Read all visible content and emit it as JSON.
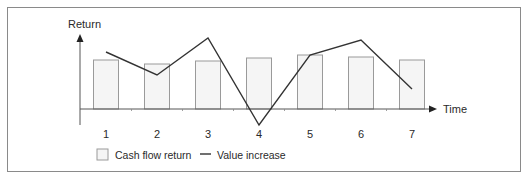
{
  "chart_data": {
    "type": "bar+line",
    "title": "",
    "xlabel": "Time",
    "ylabel": "Return",
    "categories": [
      "1",
      "2",
      "3",
      "4",
      "5",
      "6",
      "7"
    ],
    "series": [
      {
        "name": "Cash flow return",
        "kind": "bar",
        "values": [
          49,
          45,
          48,
          51,
          54,
          52,
          49
        ]
      },
      {
        "name": "Value increase",
        "kind": "line",
        "values": [
          57,
          34,
          71,
          -16,
          54,
          69,
          20
        ]
      }
    ],
    "axis_ranges": {
      "y": [
        -20,
        75
      ]
    },
    "grid": false,
    "legend_position": "bottom"
  },
  "axes": {
    "y_label": "Return",
    "x_label": "Time"
  },
  "x_ticks": [
    "1",
    "2",
    "3",
    "4",
    "5",
    "6",
    "7"
  ],
  "legend": {
    "bar_label": "Cash flow return",
    "line_label": "Value increase"
  },
  "colors": {
    "bar_fill": "#f5f5f5",
    "bar_stroke": "#9a9a9a",
    "line": "#333333",
    "axis": "#555555",
    "frame": "#8a8a8a"
  }
}
